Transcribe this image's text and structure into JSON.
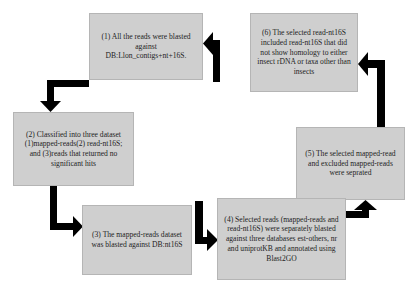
{
  "diagram": {
    "type": "cyclic-flowchart",
    "colors": {
      "box_fill": "#cfcfcf",
      "box_border": "#b5b5b5",
      "arrow": "#000000",
      "text": "#1e1e1e"
    },
    "steps": [
      {
        "id": 1,
        "text": "(1) All the reads were blasted against DB:Llon_contigs+nt+16S."
      },
      {
        "id": 2,
        "text": "(2) Classified into three dataset (1)mapped-reads(2) read-nt16S; and (3)reads that returned no significant hits"
      },
      {
        "id": 3,
        "text": "(3) The mapped-reads dataset was blasted against DB:nt16S"
      },
      {
        "id": 4,
        "text": "(4) Selected reads (mapped-reads and read-nt16S) were separately blasted against three databases est-others, nr and uniprotKB and annotated using Blast2GO"
      },
      {
        "id": 5,
        "text": "(5) The selected mapped-read and excluded mapped-reads were seprated"
      },
      {
        "id": 6,
        "text": "(6) The selected read-nt16S included read-nt16S that did not show homology to either insect rDNA or taxa other than insects"
      }
    ],
    "edges": [
      {
        "from": 1,
        "to": 2
      },
      {
        "from": 2,
        "to": 3
      },
      {
        "from": 3,
        "to": 4
      },
      {
        "from": 4,
        "to": 5
      },
      {
        "from": 5,
        "to": 6
      },
      {
        "from": 6,
        "to": 1
      }
    ]
  }
}
